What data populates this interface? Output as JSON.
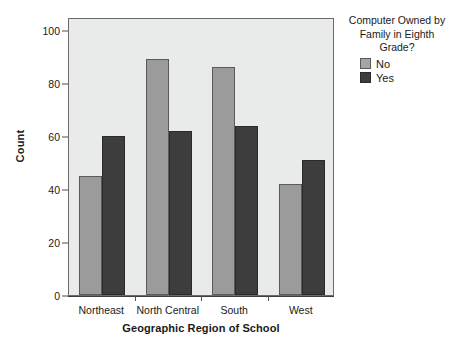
{
  "chart_data": {
    "type": "bar",
    "title": "",
    "subtitle": "",
    "xlabel": "Geographic Region of School",
    "ylabel": "Count",
    "categories": [
      "Northeast",
      "North Central",
      "South",
      "West"
    ],
    "series": [
      {
        "name": "No",
        "values": [
          45,
          89,
          86,
          42
        ],
        "color": "#9b9b9b"
      },
      {
        "name": "Yes",
        "values": [
          60,
          62,
          64,
          51
        ],
        "color": "#3d3d3d"
      }
    ],
    "ylim": [
      0,
      105
    ],
    "yticks": [
      0,
      20,
      40,
      60,
      80,
      100
    ],
    "ytick_labels": [
      "0",
      "20",
      "40",
      "60",
      "80",
      "100"
    ],
    "grid": false,
    "legend": {
      "position": "right",
      "title": "Computer Owned by Family in Eighth Grade?",
      "title_lines": [
        "Computer Owned by",
        "Family in Eighth",
        "Grade?"
      ],
      "entries": [
        {
          "label": "No",
          "swatch": "light-gray-swatch"
        },
        {
          "label": "Yes",
          "swatch": "dark-gray-swatch"
        }
      ]
    },
    "plot_background": "#e9ebeb",
    "frame_color": "#6b6b6b"
  }
}
